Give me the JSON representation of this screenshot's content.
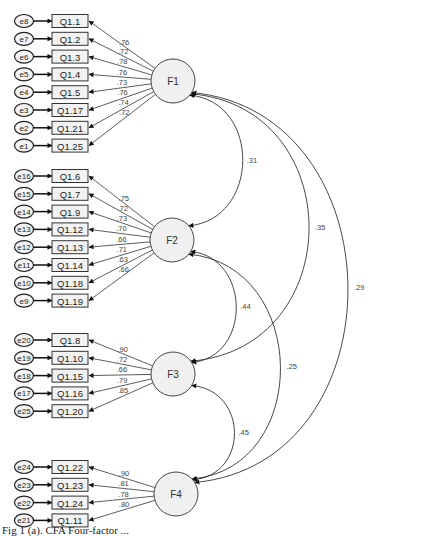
{
  "diagram": {
    "type": "CFA path diagram",
    "factors": [
      {
        "name": "F1",
        "items": [
          {
            "error": "e8",
            "item": "Q1.1",
            "loading": ".76"
          },
          {
            "error": "e7",
            "item": "Q1.2",
            "loading": ".72"
          },
          {
            "error": "e6",
            "item": "Q1.3",
            "loading": ".78"
          },
          {
            "error": "e5",
            "item": "Q1.4",
            "loading": ".76"
          },
          {
            "error": "e4",
            "item": "Q1.5",
            "loading": ".73"
          },
          {
            "error": "e3",
            "item": "Q1.17",
            "loading": ".76"
          },
          {
            "error": "e2",
            "item": "Q1.21",
            "loading": ".74"
          },
          {
            "error": "e1",
            "item": "Q1.25",
            "loading": ".72"
          }
        ]
      },
      {
        "name": "F2",
        "items": [
          {
            "error": "e16",
            "item": "Q1.6",
            "loading": ".75"
          },
          {
            "error": "e15",
            "item": "Q1.7",
            "loading": ".72"
          },
          {
            "error": "e14",
            "item": "Q1.9",
            "loading": ".73"
          },
          {
            "error": "e13",
            "item": "Q1.12",
            "loading": ".70"
          },
          {
            "error": "e12",
            "item": "Q1.13",
            "loading": ".66"
          },
          {
            "error": "e11",
            "item": "Q1.14",
            "loading": ".71"
          },
          {
            "error": "e10",
            "item": "Q1.18",
            "loading": ".63"
          },
          {
            "error": "e9",
            "item": "Q1.19",
            "loading": ".66"
          }
        ]
      },
      {
        "name": "F3",
        "items": [
          {
            "error": "e20",
            "item": "Q1.8",
            "loading": ".90"
          },
          {
            "error": "e19",
            "item": "Q1.10",
            "loading": ".72"
          },
          {
            "error": "e18",
            "item": "Q1.15",
            "loading": ".66"
          },
          {
            "error": "e17",
            "item": "Q1.16",
            "loading": ".79"
          },
          {
            "error": "e25",
            "item": "Q1.20",
            "loading": ".85"
          }
        ]
      },
      {
        "name": "F4",
        "items": [
          {
            "error": "e24",
            "item": "Q1.22",
            "loading": ".90"
          },
          {
            "error": "e23",
            "item": "Q1.23",
            "loading": ".81"
          },
          {
            "error": "e22",
            "item": "Q1.24",
            "loading": ".78"
          },
          {
            "error": "e21",
            "item": "Q1.11",
            "loading": ".80"
          }
        ]
      }
    ],
    "covariances": [
      {
        "from": "F1",
        "to": "F2",
        "value": ".31"
      },
      {
        "from": "F1",
        "to": "F3",
        "value": ".35"
      },
      {
        "from": "F1",
        "to": "F4",
        "value": ".29"
      },
      {
        "from": "F2",
        "to": "F3",
        "value": ".44"
      },
      {
        "from": "F2",
        "to": "F4",
        "value": ".25"
      },
      {
        "from": "F3",
        "to": "F4",
        "value": ".45"
      }
    ]
  },
  "caption": "Fig 1 (a). CFA  Four-factor  ..."
}
